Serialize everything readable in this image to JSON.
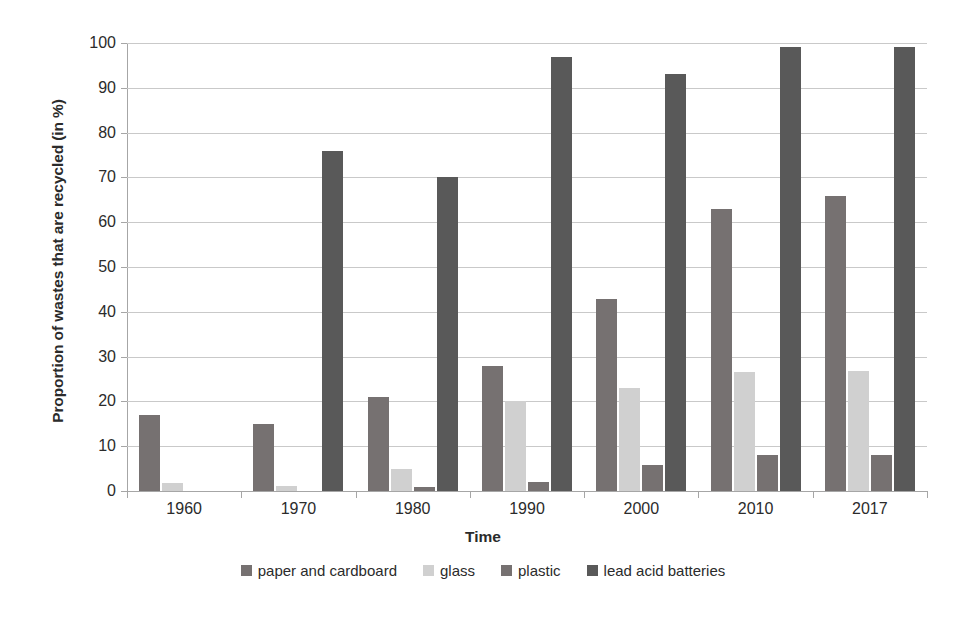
{
  "chart_data": {
    "type": "bar",
    "title": "",
    "xlabel": "Time",
    "ylabel": "Proportion of wastes that are recycled (in %)",
    "ylim": [
      0,
      100
    ],
    "ytick_step": 10,
    "yticks": [
      "100",
      "90",
      "80",
      "70",
      "60",
      "50",
      "40",
      "30",
      "20",
      "10",
      "0"
    ],
    "grid": true,
    "legend_position": "bottom",
    "categories": [
      "1960",
      "1970",
      "1980",
      "1990",
      "2000",
      "2010",
      "2017"
    ],
    "series": [
      {
        "name": "paper and cardboard",
        "color": "#767171",
        "values": [
          17,
          15,
          21,
          28,
          42.8,
          62.9,
          65.8
        ]
      },
      {
        "name": "glass",
        "color": "#d0d0d0",
        "values": [
          1.8,
          1.1,
          5,
          20,
          23,
          26.6,
          26.8
        ]
      },
      {
        "name": "plastic",
        "color": "#767171",
        "values": [
          0,
          0,
          1,
          2,
          5.9,
          8,
          8
        ]
      },
      {
        "name": "lead acid batteries",
        "color": "#595959",
        "values": [
          0,
          76,
          70,
          96.9,
          93,
          99,
          99
        ]
      }
    ]
  },
  "legend": {
    "items": [
      {
        "label": "paper and cardboard",
        "color": "#767171"
      },
      {
        "label": "glass",
        "color": "#d0d0d0"
      },
      {
        "label": "plastic",
        "color": "#767171"
      },
      {
        "label": "lead acid batteries",
        "color": "#595959"
      }
    ]
  },
  "axes": {
    "y_title": "Proportion of wastes that are recycled (in %)",
    "x_title": "Time"
  }
}
